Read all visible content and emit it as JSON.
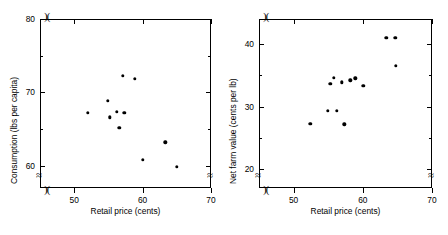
{
  "figure": {
    "caption_faint": "",
    "background": "#ffffff",
    "marker_color": "#000000",
    "axis_color": "#000000"
  },
  "chart_data": [
    {
      "type": "scatter",
      "title": "",
      "panel": "left",
      "xlabel": "Retail price (cents)",
      "ylabel": "Consumption (lbs per capita)",
      "xlim": [
        45,
        70
      ],
      "ylim": [
        57,
        80
      ],
      "xticks": [
        50,
        60,
        70
      ],
      "xticklabels": [
        "50",
        "60",
        "70"
      ],
      "yticks": [
        60,
        65,
        70,
        75,
        80
      ],
      "yticklabels": [
        "60",
        "",
        "70",
        "",
        "80"
      ],
      "grid": false,
      "legend": null,
      "axis_break_x": true,
      "axis_break_y": true,
      "points": [
        {
          "x": 52.0,
          "y": 67.2
        },
        {
          "x": 54.9,
          "y": 68.9
        },
        {
          "x": 55.2,
          "y": 66.6
        },
        {
          "x": 56.2,
          "y": 67.4
        },
        {
          "x": 56.6,
          "y": 65.2
        },
        {
          "x": 57.1,
          "y": 72.3
        },
        {
          "x": 57.3,
          "y": 67.2
        },
        {
          "x": 58.9,
          "y": 71.9
        },
        {
          "x": 60.0,
          "y": 60.8
        },
        {
          "x": 63.3,
          "y": 63.2
        },
        {
          "x": 65.0,
          "y": 59.9
        }
      ]
    },
    {
      "type": "scatter",
      "title": "",
      "panel": "right",
      "xlabel": "Retail price (cents)",
      "ylabel": "Net farm value (cents per lb)",
      "xlim": [
        45,
        70
      ],
      "ylim": [
        17,
        44
      ],
      "xticks": [
        50,
        60,
        70
      ],
      "xticklabels": [
        "50",
        "60",
        "70"
      ],
      "yticks": [
        20,
        25,
        30,
        35,
        40
      ],
      "yticklabels": [
        "20",
        "",
        "30",
        "",
        "40"
      ],
      "grid": false,
      "legend": null,
      "axis_break_x": true,
      "axis_break_y": true,
      "points": [
        {
          "x": 52.4,
          "y": 27.3
        },
        {
          "x": 54.9,
          "y": 29.3
        },
        {
          "x": 55.3,
          "y": 33.6
        },
        {
          "x": 55.8,
          "y": 34.6
        },
        {
          "x": 56.2,
          "y": 29.3
        },
        {
          "x": 57.0,
          "y": 33.9
        },
        {
          "x": 57.3,
          "y": 27.2
        },
        {
          "x": 58.2,
          "y": 34.2
        },
        {
          "x": 58.9,
          "y": 34.5
        },
        {
          "x": 60.1,
          "y": 33.3
        },
        {
          "x": 63.4,
          "y": 41.0
        },
        {
          "x": 64.7,
          "y": 41.0
        },
        {
          "x": 64.8,
          "y": 36.5
        }
      ]
    }
  ]
}
